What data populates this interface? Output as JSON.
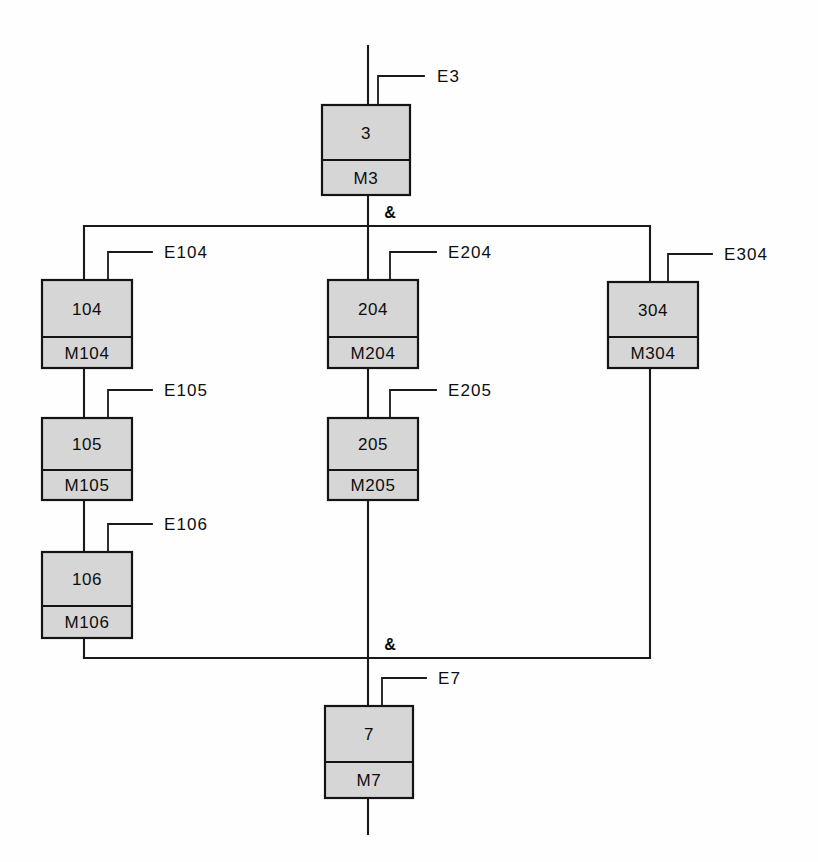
{
  "diagram": {
    "colors": {
      "block_fill": "#d6d6d6",
      "stroke": "#141414",
      "background": "#fefefe"
    },
    "junction_symbol": "&",
    "blocks": [
      {
        "id": "blk-3",
        "top_label": "3",
        "bottom_label": "M3",
        "signal_label": "E3",
        "x": 322,
        "y": 105,
        "w": 88,
        "h": 90,
        "divider_y": 160,
        "stub_x": 378,
        "stub_top": 76,
        "stub_right": 424,
        "label_x": 437,
        "label_y": 82
      },
      {
        "id": "blk-104",
        "top_label": "104",
        "bottom_label": "M104",
        "signal_label": "E104",
        "x": 42,
        "y": 280,
        "w": 90,
        "h": 88,
        "divider_y": 337,
        "stub_x": 108,
        "stub_top": 252,
        "stub_right": 152,
        "label_x": 164,
        "label_y": 258
      },
      {
        "id": "blk-105",
        "top_label": "105",
        "bottom_label": "M105",
        "signal_label": "E105",
        "x": 42,
        "y": 418,
        "w": 90,
        "h": 82,
        "divider_y": 470,
        "stub_x": 108,
        "stub_top": 390,
        "stub_right": 152,
        "label_x": 164,
        "label_y": 396
      },
      {
        "id": "blk-106",
        "top_label": "106",
        "bottom_label": "M106",
        "signal_label": "E106",
        "x": 42,
        "y": 552,
        "w": 90,
        "h": 86,
        "divider_y": 606,
        "stub_x": 108,
        "stub_top": 524,
        "stub_right": 152,
        "label_x": 164,
        "label_y": 530
      },
      {
        "id": "blk-204",
        "top_label": "204",
        "bottom_label": "M204",
        "signal_label": "E204",
        "x": 328,
        "y": 280,
        "w": 90,
        "h": 88,
        "divider_y": 337,
        "stub_x": 390,
        "stub_top": 252,
        "stub_right": 436,
        "label_x": 448,
        "label_y": 258
      },
      {
        "id": "blk-205",
        "top_label": "205",
        "bottom_label": "M205",
        "signal_label": "E205",
        "x": 328,
        "y": 418,
        "w": 90,
        "h": 82,
        "divider_y": 470,
        "stub_x": 390,
        "stub_top": 390,
        "stub_right": 436,
        "label_x": 448,
        "label_y": 396
      },
      {
        "id": "blk-304",
        "top_label": "304",
        "bottom_label": "M304",
        "signal_label": "E304",
        "x": 608,
        "y": 282,
        "w": 90,
        "h": 86,
        "divider_y": 337,
        "stub_x": 668,
        "stub_top": 254,
        "stub_right": 712,
        "label_x": 724,
        "label_y": 260
      },
      {
        "id": "blk-7",
        "top_label": "7",
        "bottom_label": "M7",
        "signal_label": "E7",
        "x": 325,
        "y": 706,
        "w": 88,
        "h": 92,
        "divider_y": 762,
        "stub_x": 382,
        "stub_top": 678,
        "stub_right": 426,
        "label_x": 438,
        "label_y": 684
      }
    ],
    "junctions": [
      {
        "id": "junction-top",
        "label": "&",
        "rail_y": 226,
        "rail_x1": 84,
        "rail_x2": 650,
        "label_x": 390,
        "label_y": 218
      },
      {
        "id": "junction-bottom",
        "label": "&",
        "rail_y": 658,
        "rail_x1": 84,
        "rail_x2": 650,
        "label_x": 390,
        "label_y": 650
      }
    ],
    "connectors": [
      {
        "id": "input-trunk-top",
        "points": "368,46 368,105"
      },
      {
        "id": "blk3-to-top-rail",
        "points": "368,195 368,286"
      },
      {
        "id": "top-rail-left-drop",
        "points": "84,226 84,280"
      },
      {
        "id": "top-rail-right-drop",
        "points": "650,226 650,288"
      },
      {
        "id": "blk104-to-blk105",
        "points": "84,368 84,418"
      },
      {
        "id": "blk105-to-blk106",
        "points": "84,500 84,552"
      },
      {
        "id": "blk106-to-bottom-rail",
        "points": "84,638 84,658"
      },
      {
        "id": "blk204-to-blk205",
        "points": "368,368 368,418"
      },
      {
        "id": "blk205-to-bottom-rail",
        "points": "368,500 368,706"
      },
      {
        "id": "blk304-to-bottom-rail",
        "points": "650,368 650,658"
      },
      {
        "id": "output-trunk-bottom",
        "points": "368,798 368,834"
      }
    ]
  }
}
